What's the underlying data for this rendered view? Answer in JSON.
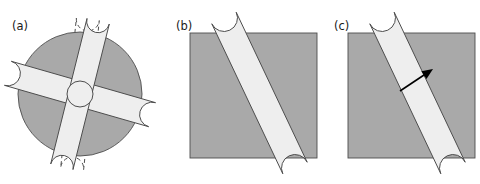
{
  "figure": {
    "type": "scientific-diagram",
    "panel_count": 3,
    "background_color": "#ffffff",
    "width": 480,
    "height": 184
  },
  "colors": {
    "body_gray": "#a9a9a9",
    "rod_light": "#eeeeee",
    "outline": "#4d4d4d",
    "arrow": "#000000",
    "label_text": "#1a1a1a",
    "dashed_outline": "#4d4d4d"
  },
  "panels": [
    {
      "id": "a",
      "label": "(a)",
      "label_x": 12,
      "label_y": 30,
      "shape": {
        "name": "circle",
        "cx": 80,
        "cy": 94,
        "r": 62,
        "fill": "#a9a9a9"
      },
      "rods": [
        {
          "name": "rod-steep",
          "cx": 80,
          "cy": 94,
          "length": 150,
          "width": 25,
          "angle_deg": 16,
          "fill": "#eeeeee",
          "dashed": false
        },
        {
          "name": "rod-shallow",
          "cx": 80,
          "cy": 94,
          "length": 150,
          "width": 23,
          "angle_deg": 104,
          "fill": "#eeeeee",
          "dashed": false
        }
      ],
      "ghost_rods": [
        {
          "name": "ghost-rod-left",
          "cx": 80,
          "cy": 94,
          "length": 150,
          "width": 23,
          "angle_deg": 96,
          "dashed": true
        }
      ],
      "center_circle": {
        "name": "center-pivot",
        "cx": 80,
        "cy": 94,
        "r": 13
      }
    },
    {
      "id": "b",
      "label": "(b)",
      "label_x": 176,
      "label_y": 30,
      "shape": {
        "name": "square",
        "x": 190,
        "y": 33,
        "width": 127,
        "height": 125,
        "fill": "#a9a9a9"
      },
      "rods": [
        {
          "name": "rod-diagonal",
          "x1": 224,
          "y1": 18,
          "x2": 295,
          "y2": 168,
          "width": 27,
          "fill": "#eeeeee",
          "dashed": false
        }
      ],
      "arrow": null
    },
    {
      "id": "c",
      "label": "(c)",
      "label_x": 334,
      "label_y": 30,
      "shape": {
        "name": "square",
        "x": 348,
        "y": 33,
        "width": 127,
        "height": 125,
        "fill": "#a9a9a9"
      },
      "rods": [
        {
          "name": "rod-diagonal",
          "x1": 382,
          "y1": 18,
          "x2": 453,
          "y2": 168,
          "width": 27,
          "fill": "#eeeeee",
          "dashed": false
        }
      ],
      "arrow": {
        "name": "direction-arrow",
        "x1": 400,
        "y1": 91,
        "x2": 433,
        "y2": 69,
        "head_size": 7,
        "color": "#000000"
      }
    }
  ]
}
